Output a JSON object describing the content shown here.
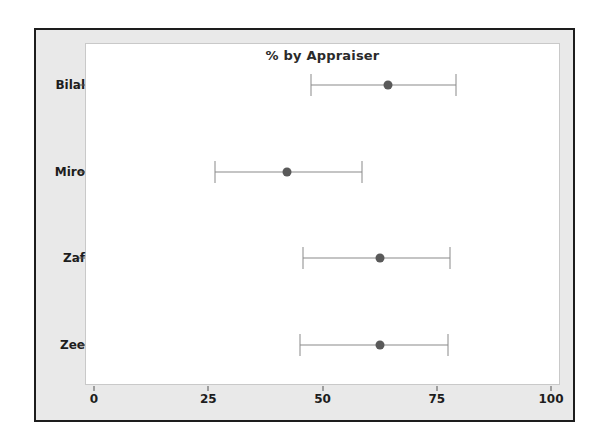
{
  "chart_data": {
    "type": "scatter",
    "title": "% by Appraiser",
    "xlabel": "",
    "ylabel": "",
    "xlim": [
      0,
      100
    ],
    "xticks": [
      0,
      25,
      50,
      75,
      100
    ],
    "xtick_labels": [
      "0",
      "25",
      "50",
      "75",
      "100"
    ],
    "grid": false,
    "legend": "none",
    "orientation": "horizontal",
    "categories": [
      "Bilal",
      "Miro",
      "Zaf",
      "Zee"
    ],
    "series": [
      {
        "name": "Percent Agreement with Confidence Interval",
        "points": [
          {
            "category": "Bilal",
            "value": 64.3,
            "lower": 47.5,
            "upper": 79.2
          },
          {
            "category": "Miro",
            "value": 42.2,
            "lower": 26.5,
            "upper": 58.6
          },
          {
            "category": "Zaf",
            "value": 62.6,
            "lower": 45.7,
            "upper": 77.9
          },
          {
            "category": "Zee",
            "value": 62.6,
            "lower": 45.1,
            "upper": 77.5
          }
        ]
      }
    ]
  },
  "style": {
    "panel_background": "#e9e9e9",
    "plot_background": "#ffffff",
    "border_color": "#1d1d1d",
    "marker_color": "#595959",
    "interval_color": "#8a8a8a",
    "text_color": "#1d1d1d"
  }
}
